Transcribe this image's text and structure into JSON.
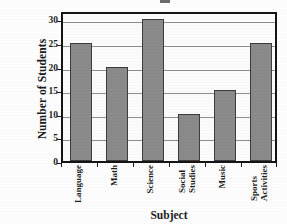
{
  "chart_data": {
    "type": "bar",
    "title": "",
    "xlabel": "Subject",
    "ylabel": "Number of Students",
    "categories": [
      "Language",
      "Math",
      "Science",
      "Social Studies",
      "Music",
      "Sports Activities"
    ],
    "category_lines": [
      [
        "Language"
      ],
      [
        "Math"
      ],
      [
        "Science"
      ],
      [
        "Social",
        "Studies"
      ],
      [
        "Music"
      ],
      [
        "Sports",
        "Activities"
      ]
    ],
    "values": [
      25,
      20,
      30,
      10,
      15,
      25
    ],
    "ylim": [
      0,
      32
    ],
    "yticks": [
      0,
      5,
      10,
      15,
      20,
      25,
      30
    ],
    "ytick_labels": [
      "0",
      "5",
      "10",
      "15",
      "20",
      "25",
      "30"
    ],
    "grid": "horizontal",
    "legend": "none",
    "bar_color": "#8a8a8a",
    "bar_edge_color": "#3c3c3c",
    "axis_color": "#141414",
    "grid_color": "#8f8f8f",
    "plot_background": "#fbfbfb",
    "label_rotation_degrees": 90
  }
}
